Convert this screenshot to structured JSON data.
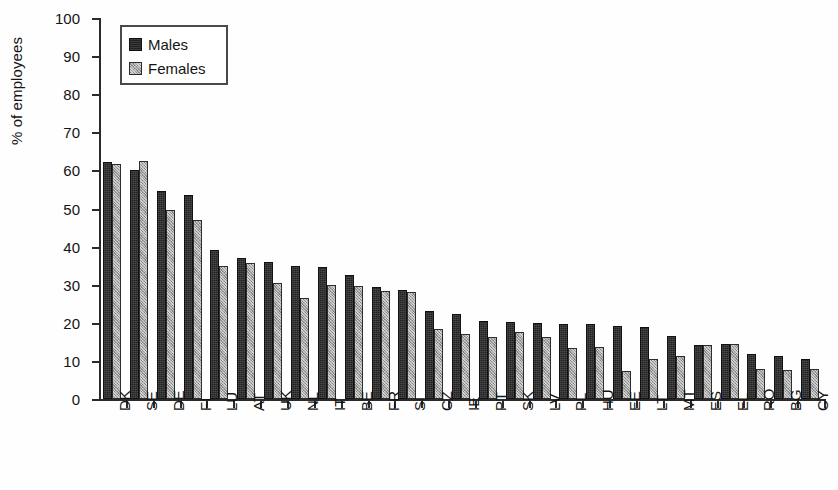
{
  "chart_data": {
    "type": "bar",
    "title": "",
    "subtitle": "",
    "xlabel": "",
    "ylabel": "% of employees",
    "ylim": [
      0,
      100
    ],
    "yticks": [
      0,
      10,
      20,
      30,
      40,
      50,
      60,
      70,
      80,
      90,
      100
    ],
    "grid": false,
    "legend_position": "top-left",
    "categories": [
      "DK",
      "SE",
      "DE",
      "FI",
      "LU",
      "AT",
      "UK",
      "NL",
      "IT",
      "BE",
      "FR",
      "SI",
      "CZ",
      "IE",
      "PT",
      "SK",
      "LV",
      "PL",
      "HU",
      "EE",
      "LT",
      "MT",
      "ES",
      "EL",
      "RO",
      "BG",
      "CY"
    ],
    "series": [
      {
        "name": "Males",
        "color": "#232323",
        "values": [
          62.3,
          60.0,
          54.6,
          53.6,
          39.0,
          37.0,
          36.0,
          35.0,
          34.7,
          32.6,
          29.3,
          28.6,
          23.0,
          22.3,
          20.6,
          20.3,
          20.0,
          19.7,
          19.6,
          19.1,
          19.0,
          16.6,
          14.3,
          14.4,
          11.7,
          11.4,
          10.6
        ]
      },
      {
        "name": "Females",
        "color": "#a2a2a2",
        "values": [
          61.6,
          62.6,
          49.5,
          46.9,
          35.0,
          35.6,
          30.4,
          26.5,
          30.0,
          29.6,
          28.3,
          28.0,
          18.3,
          17.0,
          16.3,
          17.6,
          16.3,
          13.3,
          13.6,
          7.3,
          10.5,
          11.4,
          14.3,
          14.4,
          8.0,
          7.7,
          8.0
        ]
      }
    ]
  },
  "legend": {
    "items": [
      {
        "label": "Males",
        "swatch": "male-swatch"
      },
      {
        "label": "Females",
        "swatch": "female-swatch"
      }
    ]
  }
}
